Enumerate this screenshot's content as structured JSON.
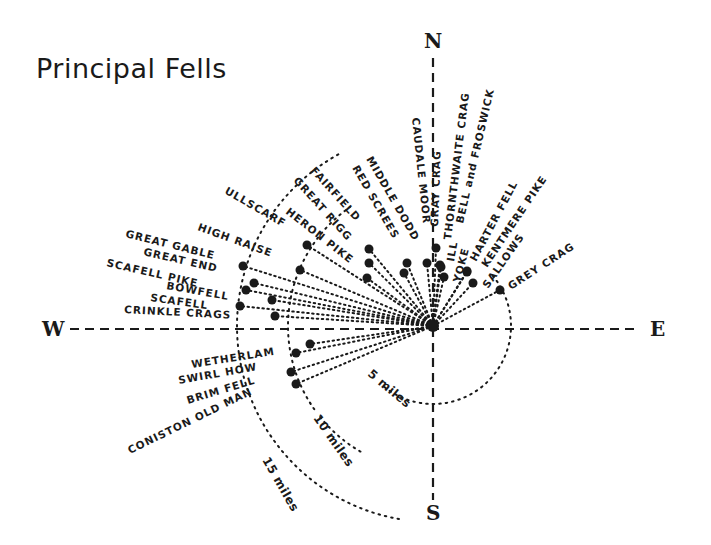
{
  "title": "Principal Fells",
  "compass": {
    "north": "N",
    "south": "S",
    "east": "E",
    "west": "W"
  },
  "center": {
    "x": 433,
    "y": 326
  },
  "rings": [
    {
      "label": "5 miles",
      "r": 78
    },
    {
      "label": "10 miles",
      "r": 145
    },
    {
      "label": "15 miles",
      "r": 196
    }
  ],
  "chart_data": {
    "type": "scatter",
    "title": "Principal Fells",
    "axes": {
      "north": "N",
      "east": "E",
      "south": "S",
      "west": "W"
    },
    "distance_rings": [
      "5 miles",
      "10 miles",
      "15 miles"
    ],
    "fells": [
      {
        "name": "GREY CRAG",
        "x": 500,
        "y": 290
      },
      {
        "name": "SALLOWS",
        "x": 473,
        "y": 283
      },
      {
        "name": "KENTMERE PIKE",
        "x": 467,
        "y": 272
      },
      {
        "name": "HARTER FELL",
        "x": 467,
        "y": 271
      },
      {
        "name": "YOKE",
        "x": 444,
        "y": 277
      },
      {
        "name": "ILL BELL and FROSWICK",
        "x": 441,
        "y": 267
      },
      {
        "name": "THORNTHWAITE CRAG",
        "x": 440,
        "y": 265
      },
      {
        "name": "GRAY CRAG",
        "x": 436,
        "y": 248
      },
      {
        "name": "CAUDALE MOOR",
        "x": 427,
        "y": 263
      },
      {
        "name": "MIDDLE DODD",
        "x": 407,
        "y": 263
      },
      {
        "name": "RED SCREES",
        "x": 404,
        "y": 273
      },
      {
        "name": "FAIRFIELD",
        "x": 369,
        "y": 249
      },
      {
        "name": "GREAT RIGG",
        "x": 369,
        "y": 263
      },
      {
        "name": "HERON PIKE",
        "x": 367,
        "y": 278
      },
      {
        "name": "ULLSCARF",
        "x": 307,
        "y": 245
      },
      {
        "name": "HIGH RAISE",
        "x": 300,
        "y": 270
      },
      {
        "name": "GREAT GABLE",
        "x": 243,
        "y": 266
      },
      {
        "name": "GREAT END",
        "x": 254,
        "y": 283
      },
      {
        "name": "SCAFELL PIKE",
        "x": 246,
        "y": 290
      },
      {
        "name": "BOWFELL",
        "x": 272,
        "y": 300
      },
      {
        "name": "SCAFELL",
        "x": 240,
        "y": 306
      },
      {
        "name": "CRINKLE CRAGS",
        "x": 275,
        "y": 316
      },
      {
        "name": "WETHERLAM",
        "x": 310,
        "y": 344
      },
      {
        "name": "SWIRL HOW",
        "x": 296,
        "y": 353
      },
      {
        "name": "BRIM FELL",
        "x": 291,
        "y": 372
      },
      {
        "name": "CONISTON OLD MAN",
        "x": 296,
        "y": 384
      }
    ]
  },
  "labels": [
    {
      "text": "GREY CRAG",
      "x": 511,
      "y": 290,
      "rot": -33
    },
    {
      "text": "SALLOWS",
      "x": 488,
      "y": 289,
      "rot": -55
    },
    {
      "text": "KENTMERE PIKE",
      "x": 487,
      "y": 268,
      "rot": -56
    },
    {
      "text": "HARTER FELL",
      "x": 476,
      "y": 262,
      "rot": -62
    },
    {
      "text": "YOKE",
      "x": 460,
      "y": 283,
      "rot": -75
    },
    {
      "text": "ILL",
      "x": 454,
      "y": 262,
      "rot": -80
    },
    {
      "text": "BELL and FROSWICK",
      "x": 463,
      "y": 224,
      "rot": -77
    },
    {
      "text": "THORNTHWAITE CRAG",
      "x": 451,
      "y": 240,
      "rot": -83
    },
    {
      "text": "GRAY CRAG",
      "x": 438,
      "y": 227,
      "rot": -88
    },
    {
      "text": "CAUDALE MOOR",
      "x": 412,
      "y": 118,
      "rot": 84
    },
    {
      "text": "MIDDLE DODD",
      "x": 366,
      "y": 159,
      "rot": 60
    },
    {
      "text": "RED SCREES",
      "x": 352,
      "y": 168,
      "rot": 60
    },
    {
      "text": "FAIRFIELD",
      "x": 310,
      "y": 171,
      "rot": 48
    },
    {
      "text": "GREAT RIGG",
      "x": 293,
      "y": 181,
      "rot": 48
    },
    {
      "text": "HERON PIKE",
      "x": 285,
      "y": 213,
      "rot": 38
    },
    {
      "text": "ULLSCARF",
      "x": 224,
      "y": 193,
      "rot": 30
    },
    {
      "text": "HIGH RAISE",
      "x": 197,
      "y": 230,
      "rot": 20
    },
    {
      "text": "GREAT GABLE",
      "x": 125,
      "y": 237,
      "rot": 14
    },
    {
      "text": "GREAT END",
      "x": 143,
      "y": 255,
      "rot": 13
    },
    {
      "text": "SCAFELL PIKE",
      "x": 106,
      "y": 266,
      "rot": 13
    },
    {
      "text": "BOWFELL",
      "x": 166,
      "y": 289,
      "rot": 10
    },
    {
      "text": "SCAFELL",
      "x": 150,
      "y": 301,
      "rot": 8
    },
    {
      "text": "CRINKLE CRAGS",
      "x": 124,
      "y": 313,
      "rot": 3
    },
    {
      "text": "WETHERLAM",
      "x": 192,
      "y": 368,
      "rot": -9
    },
    {
      "text": "SWIRL HOW",
      "x": 179,
      "y": 384,
      "rot": -10
    },
    {
      "text": "BRIM FELL",
      "x": 188,
      "y": 404,
      "rot": -17
    },
    {
      "text": "CONISTON OLD MAN",
      "x": 130,
      "y": 454,
      "rot": -26
    }
  ],
  "ring_labels": [
    {
      "text": "5 miles",
      "x": 367,
      "y": 375,
      "rot": 40
    },
    {
      "text": "10 miles",
      "x": 313,
      "y": 418,
      "rot": 55
    },
    {
      "text": "15 miles",
      "x": 262,
      "y": 460,
      "rot": 60
    }
  ]
}
